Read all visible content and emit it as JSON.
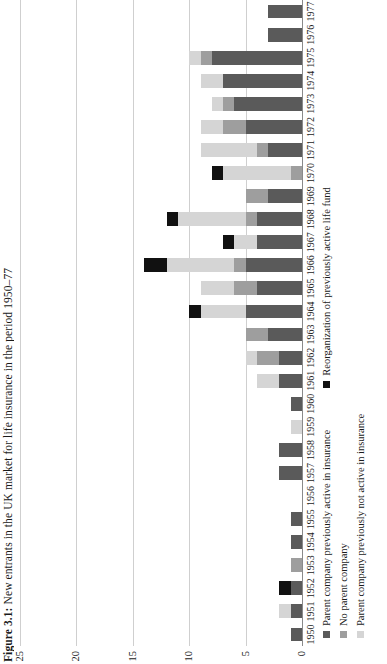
{
  "figure": {
    "number": "Figure 3.1:",
    "caption": "New entrants in the UK market for life insurance in the period 1950–77"
  },
  "axis": {
    "y_ticks": [
      "0",
      "5",
      "10",
      "15",
      "20",
      "25"
    ],
    "y_min": 0,
    "y_max": 25,
    "y_tick_values": [
      0,
      5,
      10,
      15,
      20,
      25
    ]
  },
  "legend": {
    "position": "bottom",
    "items": [
      {
        "label": "Parent company previously active in insurance",
        "color": "#5a5a5a",
        "key": "prev_active"
      },
      {
        "label": "No parent company",
        "color": "#9e9e9e",
        "key": "no_parent"
      },
      {
        "label": "Parent company previously not active in insurance",
        "color": "#d5d5d5",
        "key": "prev_not_active"
      },
      {
        "label": "Reorganization of previously active life fund",
        "color": "#111111",
        "key": "reorganization"
      }
    ]
  },
  "chart_data": {
    "type": "bar",
    "orientation": "horizontal-stacked",
    "title": "Figure 3.1: New entrants in the UK market for life insurance in the period 1950–77",
    "xlabel": "",
    "ylabel": "",
    "ylim": [
      0,
      25
    ],
    "grid": true,
    "categories": [
      "1950",
      "1951",
      "1952",
      "1953",
      "1954",
      "1955",
      "1956",
      "1957",
      "1958",
      "1959",
      "1960",
      "1961",
      "1962",
      "1963",
      "1964",
      "1965",
      "1966",
      "1967",
      "1968",
      "1969",
      "1970",
      "1971",
      "1972",
      "1973",
      "1974",
      "1975",
      "1976",
      "1977"
    ],
    "series": [
      {
        "name": "Parent company previously active in insurance",
        "color": "#5a5a5a",
        "values": [
          1,
          1,
          1,
          0,
          1,
          1,
          0,
          2,
          2,
          0,
          1,
          2,
          2,
          3,
          5,
          4,
          5,
          4,
          4,
          3,
          0,
          3,
          5,
          6,
          7,
          8,
          3,
          3
        ]
      },
      {
        "name": "No parent company",
        "color": "#9e9e9e",
        "values": [
          0,
          0,
          0,
          1,
          0,
          0,
          0,
          0,
          0,
          0,
          0,
          0,
          2,
          2,
          0,
          2,
          1,
          0,
          1,
          2,
          1,
          1,
          2,
          1,
          0,
          1,
          0,
          0
        ]
      },
      {
        "name": "Parent company previously not active in insurance",
        "color": "#d5d5d5",
        "values": [
          0,
          1,
          0,
          0,
          0,
          0,
          0,
          0,
          0,
          1,
          0,
          2,
          1,
          0,
          4,
          3,
          6,
          2,
          6,
          0,
          6,
          5,
          2,
          1,
          2,
          1,
          0,
          0
        ]
      },
      {
        "name": "Reorganization of previously active life fund",
        "color": "#111111",
        "values": [
          0,
          0,
          1,
          0,
          0,
          0,
          0,
          0,
          0,
          0,
          0,
          0,
          0,
          0,
          1,
          0,
          2,
          1,
          1,
          0,
          1,
          0,
          0,
          0,
          0,
          0,
          0,
          0
        ]
      }
    ],
    "totals": [
      1,
      2,
      2,
      1,
      1,
      1,
      0,
      2,
      2,
      1,
      1,
      4,
      5,
      5,
      10,
      9,
      14,
      7,
      12,
      5,
      8,
      9,
      9,
      8,
      9,
      10,
      3,
      3
    ],
    "stack_order_from_baseline": [
      "prev_active",
      "no_parent",
      "prev_not_active",
      "reorganization"
    ]
  }
}
